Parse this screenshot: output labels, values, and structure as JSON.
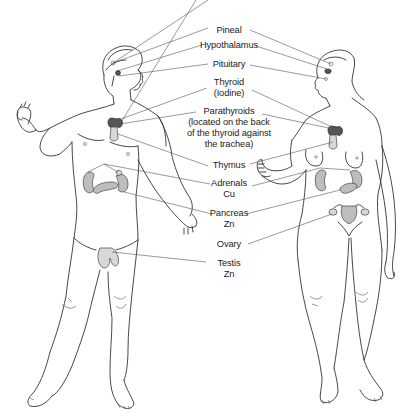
{
  "diagram": {
    "figures": [
      "male",
      "female"
    ],
    "labels": [
      {
        "id": "pineal",
        "lines": [
          "Pineal"
        ]
      },
      {
        "id": "hypothalamus",
        "lines": [
          "Hypothalamus"
        ]
      },
      {
        "id": "pituitary",
        "lines": [
          "Pituitary"
        ]
      },
      {
        "id": "thyroid",
        "lines": [
          "Thyroid",
          "(Iodine)"
        ]
      },
      {
        "id": "parathyroids",
        "lines": [
          "Parathyroids",
          "(located on the back",
          "of the thyroid against",
          "the trachea)"
        ]
      },
      {
        "id": "thymus",
        "lines": [
          "Thymus"
        ]
      },
      {
        "id": "adrenals",
        "lines": [
          "Adrenals",
          "Cu"
        ]
      },
      {
        "id": "pancreas",
        "lines": [
          "Pancreas",
          "Zn"
        ]
      },
      {
        "id": "ovary",
        "lines": [
          "Ovary"
        ]
      },
      {
        "id": "testis",
        "lines": [
          "Testis",
          "Zn"
        ]
      }
    ],
    "colors": {
      "line": "#333333",
      "organ_fill": "#bdbdbd",
      "thyroid_fill": "#555555",
      "background": "#ffffff"
    }
  }
}
